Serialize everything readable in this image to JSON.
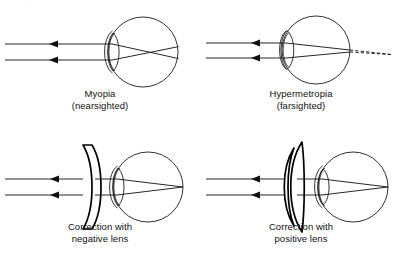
{
  "figure": {
    "kind": "optics-line-diagram",
    "background_color": "#ffffff",
    "ink_color": "#1a1a1a",
    "top_bleed_text": "of the eye"
  },
  "panels": [
    {
      "id": "myopia",
      "caption_line1": "Myopia",
      "caption_line2": "(nearsighted)",
      "has_correcting_lens": false,
      "correcting_lens": null,
      "focus_location": "in front of the retina",
      "focus_marker": "rays cross inside the vitreous then diverge onto the retina",
      "dashed_extension": false,
      "incoming_rays": 2
    },
    {
      "id": "hypermetropia",
      "caption_line1": "Hypermetropia",
      "caption_line2": "(farsighted)",
      "has_correcting_lens": false,
      "correcting_lens": null,
      "focus_location": "behind the retina",
      "focus_marker": "rays still converging at the retina; dashed lines meet at a virtual focus behind the eye",
      "dashed_extension": true,
      "incoming_rays": 2
    },
    {
      "id": "negative-correction",
      "caption_line1": "Correction with",
      "caption_line2": "negative lens",
      "has_correcting_lens": true,
      "correcting_lens": "biconcave negative (diverging) spectacle lens",
      "focus_location": "on the retina",
      "focus_marker": "rays meet exactly at the retina",
      "dashed_extension": false,
      "incoming_rays": 2
    },
    {
      "id": "positive-correction",
      "caption_line1": "Correction with",
      "caption_line2": "positive lens",
      "has_correcting_lens": true,
      "correcting_lens": "meniscus positive (converging) spectacle lens",
      "focus_location": "on the retina",
      "focus_marker": "rays meet exactly at the retina",
      "dashed_extension": false,
      "incoming_rays": 2
    }
  ]
}
